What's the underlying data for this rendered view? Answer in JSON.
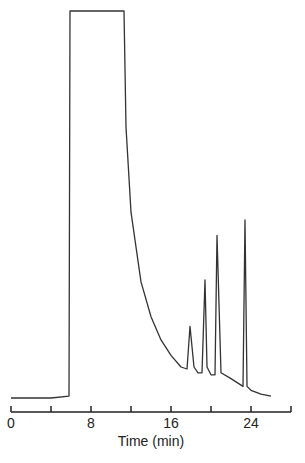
{
  "chart_data": {
    "type": "line",
    "title": "",
    "xlabel": "Time (min)",
    "ylabel": "",
    "xlim": [
      0,
      28
    ],
    "x_ticks": [
      0,
      4,
      8,
      12,
      16,
      20,
      24,
      28
    ],
    "x_tick_labels": [
      "0",
      "8",
      "16",
      "24"
    ],
    "grid": false,
    "legend": null,
    "series": [
      {
        "name": "chromatogram",
        "description": "Detector response (relative units, 0 = baseline, 100 = plateau/off-scale)",
        "x": [
          0,
          4.0,
          5.8,
          5.9,
          11.3,
          11.5,
          12.0,
          13.0,
          14.0,
          15.0,
          16.0,
          17.0,
          17.6,
          17.9,
          18.3,
          18.7,
          19.1,
          19.4,
          19.6,
          20.0,
          20.4,
          20.6,
          21.0,
          22.0,
          23.2,
          23.4,
          23.6,
          24.0,
          25.0,
          26.0
        ],
        "values": [
          0,
          0,
          0.5,
          100,
          100,
          70,
          48,
          30,
          21,
          15,
          11,
          8,
          7.5,
          18.5,
          8,
          6.5,
          6.5,
          30.5,
          8,
          6,
          6,
          42,
          6.5,
          5,
          3,
          46,
          3,
          2,
          1,
          0.5
        ]
      }
    ],
    "peaks": [
      {
        "time_min": 17.9,
        "label": "peak-1"
      },
      {
        "time_min": 19.4,
        "label": "peak-2"
      },
      {
        "time_min": 20.6,
        "label": "peak-3"
      },
      {
        "time_min": 23.4,
        "label": "peak-4"
      }
    ]
  },
  "axis": {
    "xlabel": "Time (min)",
    "tick_labels": [
      {
        "value": 0,
        "text": "0"
      },
      {
        "value": 8,
        "text": "8"
      },
      {
        "value": 16,
        "text": "16"
      },
      {
        "value": 24,
        "text": "24"
      }
    ]
  }
}
